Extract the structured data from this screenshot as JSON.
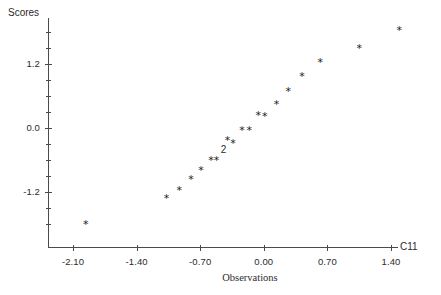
{
  "chart_data": {
    "type": "scatter",
    "title": "",
    "ylabel": "Scores",
    "xlabel": "Observations",
    "series_label": "C11",
    "marker": "*",
    "grid": false,
    "legend": "none",
    "xlim": [
      -2.45,
      1.75
    ],
    "ylim": [
      -2.05,
      2.05
    ],
    "xticks": [
      "-2.10",
      "-1.40",
      "-0.70",
      "0.00",
      "0.70",
      "1.40"
    ],
    "xtick_values": [
      -2.1,
      -1.4,
      -0.7,
      0.0,
      0.7,
      1.4
    ],
    "yticks": [
      "1.2",
      "0.0",
      "-1.2"
    ],
    "ytick_values": [
      1.2,
      0.0,
      -1.2
    ],
    "y_minor_ticks": [
      1.8,
      1.5,
      0.9,
      0.6,
      0.3,
      -0.3,
      -0.6,
      -0.9,
      -1.5,
      -1.8
    ],
    "annotations": [
      {
        "text": "2",
        "x": -0.44,
        "y": -0.42,
        "meaning": "two-overlapping-points"
      }
    ],
    "points": [
      {
        "x": -1.96,
        "y": -1.82
      },
      {
        "x": -1.07,
        "y": -1.33
      },
      {
        "x": -0.93,
        "y": -1.18
      },
      {
        "x": -0.8,
        "y": -0.97
      },
      {
        "x": -0.69,
        "y": -0.8
      },
      {
        "x": -0.58,
        "y": -0.61
      },
      {
        "x": -0.52,
        "y": -0.61
      },
      {
        "x": -0.4,
        "y": -0.24
      },
      {
        "x": -0.34,
        "y": -0.3
      },
      {
        "x": -0.24,
        "y": -0.05
      },
      {
        "x": -0.16,
        "y": -0.06
      },
      {
        "x": -0.06,
        "y": 0.22
      },
      {
        "x": 0.01,
        "y": 0.21
      },
      {
        "x": 0.14,
        "y": 0.44
      },
      {
        "x": 0.27,
        "y": 0.68
      },
      {
        "x": 0.42,
        "y": 0.96
      },
      {
        "x": 0.62,
        "y": 1.22
      },
      {
        "x": 1.05,
        "y": 1.49
      },
      {
        "x": 1.49,
        "y": 1.82
      }
    ]
  },
  "axes": {
    "y_title": "Scores",
    "x_title": "Observations",
    "series_name": "C11"
  }
}
